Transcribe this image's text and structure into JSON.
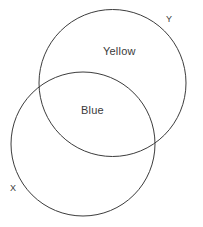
{
  "diagram": {
    "kind": "venn-diagram",
    "background_color": "#ffffff",
    "stroke_color": "#3c3c3c",
    "text_color": "#3a3a3a",
    "sets": [
      {
        "id": "y",
        "label": "Y",
        "label_x": 168,
        "label_y": 21,
        "center_x": 112.5,
        "center_y": 83,
        "radius": 73.5
      },
      {
        "id": "x",
        "label": "X",
        "label_x": 12,
        "label_y": 190,
        "center_x": 83,
        "center_y": 144,
        "radius": 72
      }
    ],
    "regions": [
      {
        "id": "y-only",
        "label": "Yellow",
        "label_x": 120,
        "label_y": 52,
        "belongs_to": "Y"
      },
      {
        "id": "x-and-y",
        "label": "Blue",
        "label_x": 93,
        "label_y": 112,
        "belongs_to": "X ∩ Y"
      }
    ]
  },
  "chart_data": {
    "type": "diagram",
    "title": "",
    "sets": [
      "X",
      "Y"
    ],
    "region_labels": {
      "Y_only": "Yellow",
      "X_intersect_Y": "Blue",
      "X_only": ""
    }
  }
}
